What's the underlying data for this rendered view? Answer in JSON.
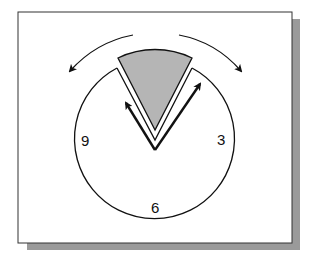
{
  "figure": {
    "colors": {
      "background": "#ffffff",
      "frame_border": "#333333",
      "shadow": "#9a9a9a",
      "sector_fill": "#b5b5b5",
      "stroke": "#111111"
    },
    "clock": {
      "numbers": [
        {
          "label": "9",
          "position": "left"
        },
        {
          "label": "3",
          "position": "right"
        },
        {
          "label": "6",
          "position": "bottom"
        }
      ]
    },
    "elements": {
      "shaded_sector": "gray wedge at 12 o'clock position",
      "hands": [
        "left hand arrow",
        "right hand arrow"
      ],
      "rotation_arrows": [
        "counter-clockwise arrow (left)",
        "clockwise arrow (right)"
      ]
    }
  }
}
